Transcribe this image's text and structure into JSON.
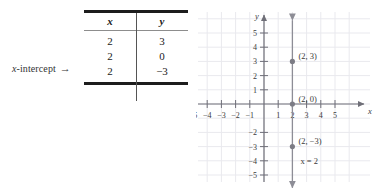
{
  "annotation": {
    "label_prefix": "x",
    "label_rest": "-intercept",
    "arrow": "→"
  },
  "table": {
    "headers": [
      "x",
      "y"
    ],
    "rows": [
      {
        "x": "2",
        "y": "3"
      },
      {
        "x": "2",
        "y": "0"
      },
      {
        "x": "2",
        "y": "−3"
      }
    ]
  },
  "chart_data": {
    "type": "scatter",
    "title": "",
    "xlabel": "x",
    "ylabel": "y",
    "xlim": [
      -6,
      6
    ],
    "ylim": [
      -6,
      6
    ],
    "grid": true,
    "legend": null,
    "x_ticks": [
      -5,
      -4,
      -3,
      -2,
      -1,
      1,
      2,
      3,
      4,
      5
    ],
    "x_tick_labels": [
      "−5",
      "−4",
      "−3",
      "−2",
      "−1",
      "1",
      "2",
      "3",
      "4",
      "5"
    ],
    "y_ticks": [
      5,
      4,
      3,
      2,
      1,
      -2,
      -3,
      -4,
      -5
    ],
    "y_tick_labels": [
      "5",
      "4",
      "3",
      "2",
      "1",
      "−2",
      "−3",
      "−4",
      "−5"
    ],
    "points": [
      {
        "x": 2,
        "y": 3,
        "label": "(2, 3)"
      },
      {
        "x": 2,
        "y": 0,
        "label": "(2, 0)"
      },
      {
        "x": 2,
        "y": -3,
        "label": "(2, −3)"
      }
    ],
    "lines": [
      {
        "equation": "x = 2",
        "type": "vertical",
        "x": 2,
        "label": "x = 2"
      }
    ],
    "colors": {
      "grid": "#e9e9ee",
      "axis": "#6f6f78",
      "plot_line": "#8d8d96",
      "point": "#7c7c85",
      "text": "#3a3a3a"
    }
  }
}
